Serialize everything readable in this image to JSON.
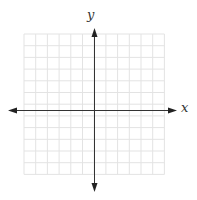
{
  "diagram": {
    "type": "cartesian-coordinate-plane",
    "x_axis_label": "x",
    "y_axis_label": "y",
    "grid": {
      "columns": 12,
      "rows": 12,
      "left": 24,
      "top": 34,
      "cell_size": 11.7,
      "line_color": "#e3e3e3"
    },
    "axes": {
      "origin_x": 94,
      "origin_y": 110,
      "x_start": 8,
      "x_end": 177,
      "y_start": 28,
      "y_end": 192,
      "color": "#333333"
    }
  }
}
